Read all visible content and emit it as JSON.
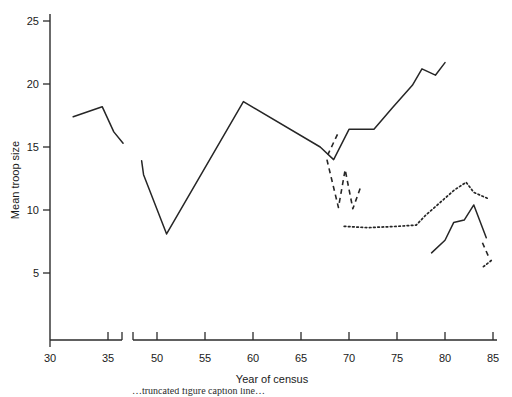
{
  "figure": {
    "name": "mean-troop-size-vs-year-of-census",
    "background": "#ffffff",
    "ink_color": "#262626"
  },
  "axes": {
    "x": {
      "title": "Year of census",
      "tick_labels": [
        "30",
        "35",
        "50",
        "55",
        "60",
        "65",
        "70",
        "75",
        "80",
        "85"
      ],
      "has_axis_break": true,
      "break_between": [
        "36",
        "48"
      ]
    },
    "y": {
      "title": "Mean troop size",
      "tick_labels": [
        "5",
        "10",
        "15",
        "20",
        "25"
      ]
    }
  },
  "caption": {
    "partial_text": "…truncated figure caption line…"
  },
  "chart_data": {
    "type": "line",
    "title": "",
    "xlabel": "Year of census",
    "ylabel": "Mean troop size",
    "xlim": [
      30,
      86
    ],
    "ylim": [
      0,
      26
    ],
    "xticks": [
      30,
      35,
      50,
      55,
      60,
      65,
      70,
      75,
      80,
      85
    ],
    "yticks": [
      5,
      10,
      15,
      20,
      25
    ],
    "axis_break": {
      "from": 36.5,
      "to": 48.0
    },
    "grid": false,
    "legend": "none",
    "series": [
      {
        "name": "early-solid-segment",
        "style": "solid",
        "x": [
          32.0,
          34.5,
          35.5,
          36.3
        ],
        "values": [
          17.4,
          18.2,
          16.2,
          15.3
        ]
      },
      {
        "name": "main-solid-segment",
        "style": "solid",
        "x": [
          48.4,
          48.6,
          51.0,
          59.0,
          67.0,
          68.4,
          70.0,
          72.6,
          74.5,
          76.6,
          77.6,
          79.0,
          80.0
        ],
        "values": [
          13.9,
          12.8,
          8.1,
          18.6,
          15.0,
          14.0,
          16.4,
          16.4,
          18.1,
          19.9,
          21.2,
          20.7,
          21.7
        ]
      },
      {
        "name": "dashed-upper-tick",
        "style": "dashed",
        "x": [
          68.8,
          67.8
        ],
        "values": [
          16.0,
          14.4
        ]
      },
      {
        "name": "dashed-zigzag-segment",
        "style": "dashed",
        "x": [
          67.7,
          68.9,
          69.6,
          70.4,
          71.2
        ],
        "values": [
          14.0,
          10.2,
          13.2,
          10.1,
          11.8
        ]
      },
      {
        "name": "dotted-lower-long-segment",
        "style": "dotted",
        "x": [
          69.5,
          72.0,
          75.0,
          77.0,
          78.0,
          79.5,
          81.0,
          82.2,
          83.0,
          84.5
        ],
        "values": [
          8.7,
          8.6,
          8.7,
          8.8,
          9.6,
          10.6,
          11.6,
          12.2,
          11.4,
          10.9
        ]
      },
      {
        "name": "late-solid-low-segment",
        "style": "solid",
        "x": [
          78.6,
          80.0,
          80.9,
          82.0,
          83.0,
          84.3
        ],
        "values": [
          6.6,
          7.6,
          9.0,
          9.2,
          10.4,
          7.8
        ]
      },
      {
        "name": "late-dashed-fragment",
        "style": "dashed",
        "x": [
          83.9,
          84.6
        ],
        "values": [
          7.4,
          6.2
        ]
      },
      {
        "name": "late-dotted-fragment",
        "style": "dotted",
        "x": [
          84.0,
          85.0
        ],
        "values": [
          5.5,
          6.1
        ]
      }
    ]
  }
}
